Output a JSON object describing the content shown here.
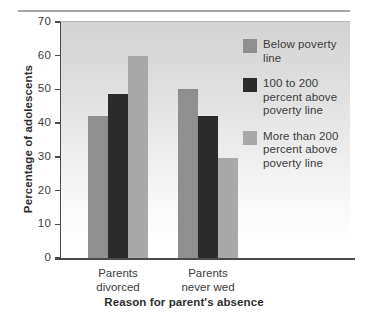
{
  "chart_data": {
    "type": "bar",
    "title": "",
    "xlabel": "Reason for parent's absence",
    "ylabel": "Percentage of adolescents",
    "categories": [
      "Parents divorced",
      "Parents never wed"
    ],
    "category_lines": [
      [
        "Parents",
        "divorced"
      ],
      [
        "Parents",
        "never wed"
      ]
    ],
    "ylim": [
      0,
      70
    ],
    "yticks": [
      0,
      10,
      20,
      30,
      40,
      50,
      60,
      70
    ],
    "ytick_labels": [
      "0",
      "10",
      "20",
      "30",
      "40",
      "50",
      "60",
      "70"
    ],
    "grid": false,
    "legend_position": "inside-top-right",
    "series": [
      {
        "name": "Below poverty line",
        "name_lines": [
          "Below poverty",
          "line"
        ],
        "color": "#8f8f8f",
        "values": [
          42,
          50
        ]
      },
      {
        "name": "100 to 200 percent above poverty line",
        "name_lines": [
          "100 to 200",
          "percent above",
          "poverty line"
        ],
        "color": "#2b2b2b",
        "values": [
          48.7,
          42
        ]
      },
      {
        "name": "More than 200 percent above poverty line",
        "name_lines": [
          "More than 200",
          "percent above",
          "poverty line"
        ],
        "color": "#a9a9a9",
        "values": [
          59.8,
          29.8
        ]
      }
    ]
  },
  "colors": {
    "axis": "#4a4a4a",
    "text": "#3b3b3b",
    "rule": "#a6a6a6",
    "plot_bg_top": "#d3d3d3",
    "plot_bg_bottom": "#ffffff"
  }
}
